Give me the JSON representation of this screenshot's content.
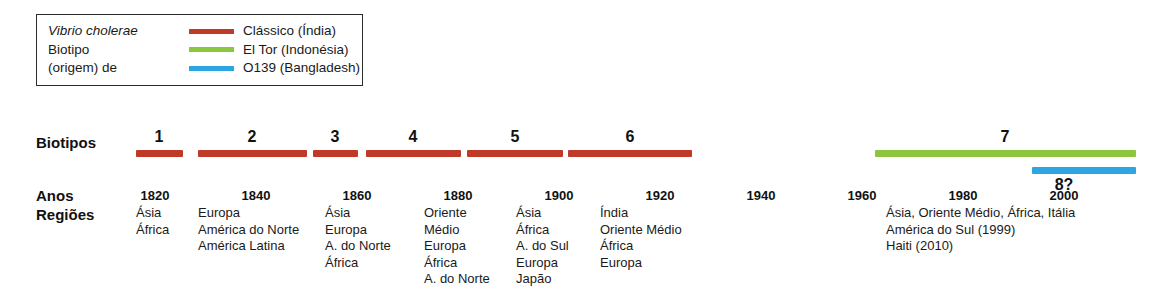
{
  "figure": {
    "width": 1165,
    "height": 290,
    "background": "#ffffff"
  },
  "legend": {
    "title_line1": "Vibrio cholerae",
    "title_line2": "Biotipo",
    "title_line3": "(origem) de",
    "items": [
      {
        "label": "Clássico (Índia)",
        "color": "#bf3a28",
        "swatch_name": "classico-swatch"
      },
      {
        "label": "El Tor (Indonésia)",
        "color": "#8cc63f",
        "swatch_name": "eltor-swatch"
      },
      {
        "label": "O139 (Bangladesh)",
        "color": "#2ba6e0",
        "swatch_name": "o139-swatch"
      }
    ]
  },
  "row_labels": {
    "biotipos": "Biotipos",
    "anos": "Anos",
    "regioes": "Regiões"
  },
  "chart_data": {
    "type": "timeline",
    "xlabel": "Anos",
    "xlim": [
      1814,
      2012
    ],
    "grid": false,
    "legend_position": "top-left",
    "axis_ticks": [
      {
        "label": "1820",
        "value": 1820,
        "x": 155
      },
      {
        "label": "1840",
        "value": 1840,
        "x": 256
      },
      {
        "label": "1860",
        "value": 1860,
        "x": 357
      },
      {
        "label": "1880",
        "value": 1880,
        "x": 458
      },
      {
        "label": "1900",
        "value": 1900,
        "x": 559
      },
      {
        "label": "1920",
        "value": 1920,
        "x": 660
      },
      {
        "label": "1940",
        "value": 1940,
        "x": 761
      },
      {
        "label": "1960",
        "value": 1960,
        "x": 862
      },
      {
        "label": "1980",
        "value": 1980,
        "x": 963
      },
      {
        "label": "2000",
        "value": 2000,
        "x": 1064
      }
    ],
    "bars": [
      {
        "pandemic": "1",
        "biotype": "Clássico",
        "color": "#bf3a28",
        "start_year": 1817,
        "end_year": 1826,
        "x": 136,
        "width": 47,
        "y": 150,
        "label_x": 159
      },
      {
        "pandemic": "2",
        "biotype": "Clássico",
        "color": "#bf3a28",
        "start_year": 1829,
        "end_year": 1851,
        "x": 198,
        "width": 109,
        "y": 150,
        "label_x": 252
      },
      {
        "pandemic": "3",
        "biotype": "Clássico",
        "color": "#bf3a28",
        "start_year": 1852,
        "end_year": 1861,
        "x": 313,
        "width": 45,
        "y": 150,
        "label_x": 335
      },
      {
        "pandemic": "4",
        "biotype": "Clássico",
        "color": "#bf3a28",
        "start_year": 1863,
        "end_year": 1882,
        "x": 366,
        "width": 95,
        "y": 150,
        "label_x": 413
      },
      {
        "pandemic": "5",
        "biotype": "Clássico",
        "color": "#bf3a28",
        "start_year": 1884,
        "end_year": 1903,
        "x": 467,
        "width": 96,
        "y": 150,
        "label_x": 515
      },
      {
        "pandemic": "6",
        "biotype": "Clássico",
        "color": "#bf3a28",
        "start_year": 1904,
        "end_year": 1929,
        "x": 568,
        "width": 124,
        "y": 150,
        "label_x": 630
      },
      {
        "pandemic": "7",
        "biotype": "El Tor",
        "color": "#8cc63f",
        "start_year": 1961,
        "end_year": 2012,
        "x": 875,
        "width": 261,
        "y": 150,
        "label_x": 1005
      },
      {
        "pandemic": "8?",
        "biotype": "O139",
        "color": "#2ba6e0",
        "start_year": 1992,
        "end_year": 2012,
        "x": 1032,
        "width": 104,
        "y": 167,
        "label_x": 1064
      }
    ],
    "region_columns": [
      {
        "anchor_year": 1820,
        "x": 136,
        "lines": [
          "Ásia",
          "África"
        ]
      },
      {
        "anchor_year": 1840,
        "x": 198,
        "lines": [
          "Europa",
          "América do Norte",
          "América Latina"
        ]
      },
      {
        "anchor_year": 1860,
        "x": 325,
        "lines": [
          "Ásia",
          "Europa",
          "A. do Norte",
          "África"
        ]
      },
      {
        "anchor_year": 1880,
        "x": 424,
        "lines": [
          "Oriente",
          "Médio",
          "Europa",
          "África",
          "A. do Norte"
        ]
      },
      {
        "anchor_year": 1900,
        "x": 516,
        "lines": [
          "Ásia",
          "África",
          "A. do Sul",
          "Europa",
          "Japão"
        ]
      },
      {
        "anchor_year": 1920,
        "x": 600,
        "lines": [
          "Índia",
          "Oriente Médio",
          "África",
          "Europa"
        ]
      }
    ],
    "region_block_modern": {
      "anchor_year": 1961,
      "x": 886,
      "lines": [
        "Ásia, Oriente Médio, África, Itália",
        "América do Sul (1999)",
        "Haiti (2010)"
      ]
    }
  }
}
